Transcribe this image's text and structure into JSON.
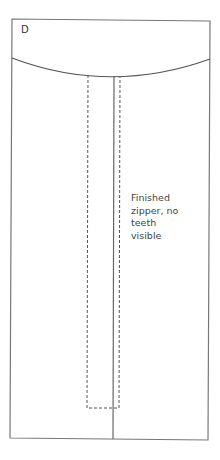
{
  "diagram": {
    "panel_label": "D",
    "annotation": {
      "lines": [
        "Finished",
        "zipper, no",
        "teeth",
        "visible"
      ]
    },
    "colors": {
      "stroke": "#777777",
      "text": "#444444",
      "background": "#ffffff"
    }
  }
}
